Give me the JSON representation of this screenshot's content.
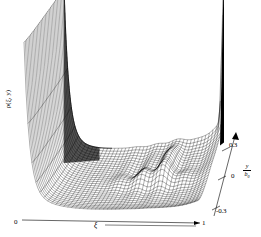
{
  "figure": {
    "type": "3d-surface-wireframe",
    "title": "",
    "background_color": "#ffffff",
    "line_color": "#000000"
  },
  "axes": {
    "z": {
      "label": "ρ(ξ, y)",
      "name": "density-axis"
    },
    "x": {
      "label": "ξ",
      "tick_labels": [
        "0",
        "1"
      ],
      "min_label": "0",
      "max_label": "1",
      "has_arrow": true
    },
    "y": {
      "label_numerator": "y",
      "label_denominator": "b",
      "label_denominator_sub": "0",
      "tick_labels": [
        "0.3",
        "0",
        "-0.3"
      ],
      "has_arrow": true
    }
  },
  "chart_data": {
    "type": "line",
    "xlabel": "ξ",
    "ylabel": "y/b₀",
    "zlabel": "ρ(ξ, y)",
    "xlim": [
      0,
      1
    ],
    "ylim": [
      -0.3,
      0.3
    ],
    "grid": false,
    "legend": "none",
    "annotations": [
      "tall ridge peak at ξ = 0 (left boundary)",
      "tall narrow spike at ξ = 1, y/b₀ = 0.3 (back right corner)",
      "rippled / corrugated mid-region near ξ ≈ 0.6-0.8"
    ],
    "grid_nx": 44,
    "grid_ny": 30,
    "x": [
      0.0,
      0.023,
      0.047,
      0.07,
      0.093,
      0.116,
      0.14,
      0.163,
      0.186,
      0.209,
      0.233,
      0.256,
      0.279,
      0.302,
      0.326,
      0.349,
      0.372,
      0.395,
      0.419,
      0.442,
      0.465,
      0.488,
      0.512,
      0.535,
      0.558,
      0.581,
      0.605,
      0.628,
      0.651,
      0.674,
      0.698,
      0.721,
      0.744,
      0.767,
      0.791,
      0.814,
      0.837,
      0.86,
      0.884,
      0.907,
      0.93,
      0.953,
      0.977,
      1.0
    ],
    "y": [
      -0.3,
      -0.279,
      -0.259,
      -0.238,
      -0.217,
      -0.197,
      -0.176,
      -0.155,
      -0.134,
      -0.114,
      -0.093,
      -0.072,
      -0.052,
      -0.031,
      -0.01,
      0.01,
      0.031,
      0.052,
      0.072,
      0.093,
      0.114,
      0.134,
      0.155,
      0.176,
      0.197,
      0.217,
      0.238,
      0.259,
      0.279,
      0.3
    ],
    "series": [
      {
        "name": "rho_profile_along_xi_at_y_center",
        "values": [
          1.0,
          0.72,
          0.52,
          0.37,
          0.27,
          0.2,
          0.15,
          0.12,
          0.1,
          0.09,
          0.08,
          0.08,
          0.08,
          0.08,
          0.08,
          0.08,
          0.08,
          0.08,
          0.09,
          0.09,
          0.1,
          0.1,
          0.11,
          0.12,
          0.13,
          0.14,
          0.16,
          0.18,
          0.2,
          0.19,
          0.17,
          0.16,
          0.15,
          0.14,
          0.14,
          0.13,
          0.13,
          0.13,
          0.13,
          0.13,
          0.14,
          0.15,
          0.2,
          0.45
        ]
      },
      {
        "name": "rho_profile_along_xi_at_y_edge",
        "values": [
          1.0,
          0.74,
          0.55,
          0.41,
          0.31,
          0.24,
          0.19,
          0.16,
          0.14,
          0.13,
          0.12,
          0.12,
          0.12,
          0.12,
          0.12,
          0.13,
          0.13,
          0.14,
          0.15,
          0.16,
          0.18,
          0.2,
          0.23,
          0.27,
          0.32,
          0.38,
          0.44,
          0.48,
          0.45,
          0.38,
          0.32,
          0.28,
          0.26,
          0.25,
          0.24,
          0.24,
          0.25,
          0.27,
          0.3,
          0.35,
          0.45,
          0.6,
          0.85,
          1.0
        ]
      }
    ]
  }
}
